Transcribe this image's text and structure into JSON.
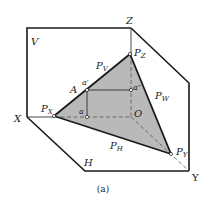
{
  "figure": {
    "caption": "(a)",
    "colors": {
      "plane_fill": "#b9b9b9",
      "line": "#1a1a1a",
      "dashed": "#555555",
      "background": "#ffffff"
    }
  },
  "planes": {
    "V": "V",
    "H": "H",
    "W": "W"
  },
  "axes": {
    "X": "X",
    "Y": "Y",
    "Z": "Z",
    "O": "O"
  },
  "traces": {
    "PX": {
      "main": "P",
      "sub": "X"
    },
    "PY": {
      "main": "P",
      "sub": "Y"
    },
    "PZ": {
      "main": "P",
      "sub": "Z"
    },
    "PV": {
      "main": "P",
      "sub": "V"
    },
    "PH": {
      "main": "P",
      "sub": "H"
    },
    "PW": {
      "main": "P",
      "sub": "W"
    }
  },
  "points": {
    "A": "A",
    "a": "a",
    "a_prime": "a′",
    "a_double_prime": "a″"
  }
}
